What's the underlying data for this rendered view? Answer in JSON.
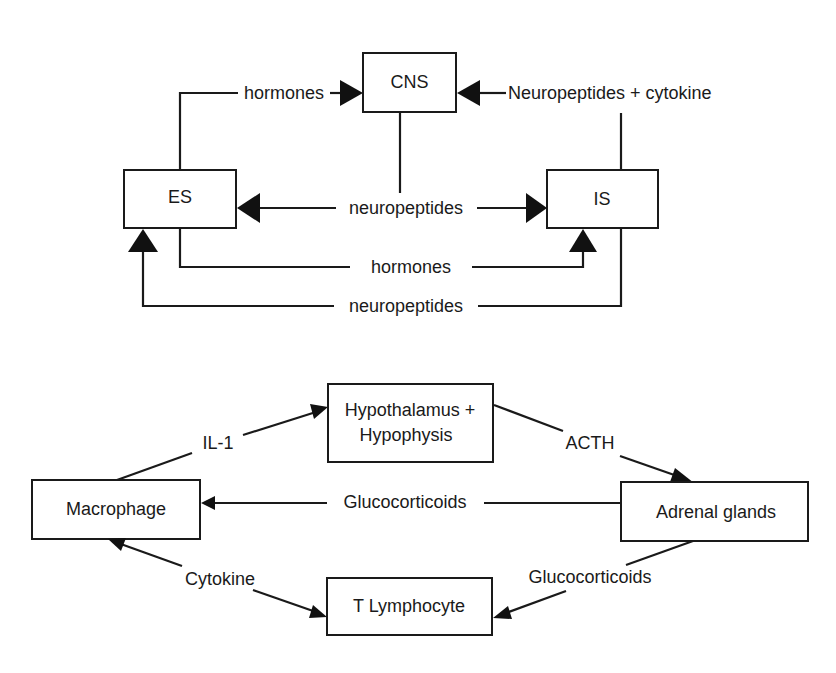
{
  "diagram_top": {
    "nodes": {
      "cns": "CNS",
      "es": "ES",
      "is": "IS"
    },
    "edges": {
      "es_to_cns": "hormones",
      "is_to_cns": "Neuropeptides + cytokine",
      "cns_es_is": "neuropeptides",
      "es_to_is": "hormones",
      "is_to_es": "neuropeptides"
    }
  },
  "diagram_bottom": {
    "nodes": {
      "hypothalamus_line1": "Hypothalamus +",
      "hypothalamus_line2": "Hypophysis",
      "macrophage": "Macrophage",
      "adrenal": "Adrenal glands",
      "t_lymphocyte": "T Lymphocyte"
    },
    "edges": {
      "macrophage_to_hypothalamus": "IL-1",
      "hypothalamus_to_adrenal": "ACTH",
      "adrenal_to_macrophage": "Glucocorticoids",
      "macrophage_tlymph": "Cytokine",
      "adrenal_to_tlymph": "Glucocorticoids"
    }
  },
  "colors": {
    "ink": "#1a1a1a",
    "background": "#ffffff"
  }
}
